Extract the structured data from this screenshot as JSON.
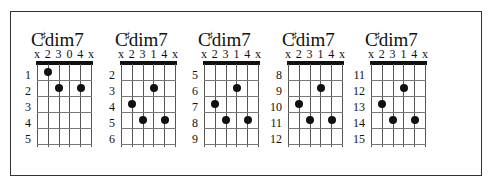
{
  "chord_name_root": "C",
  "chord_name_accidental": "♯",
  "chord_name_suffix": "dim7",
  "chords": [
    {
      "left": 37,
      "fingering": [
        "x",
        "2",
        "3",
        "0",
        "4",
        "x"
      ],
      "fret_labels": [
        "1",
        "2",
        "3",
        "4",
        "5"
      ],
      "dots": [
        {
          "string": 1,
          "row": 1
        },
        {
          "string": 2,
          "row": 2
        },
        {
          "string": 4,
          "row": 2
        }
      ]
    },
    {
      "left": 121,
      "fingering": [
        "x",
        "2",
        "3",
        "1",
        "4",
        "x"
      ],
      "fret_labels": [
        "2",
        "3",
        "4",
        "5",
        "6"
      ],
      "dots": [
        {
          "string": 3,
          "row": 2
        },
        {
          "string": 1,
          "row": 3
        },
        {
          "string": 2,
          "row": 4
        },
        {
          "string": 4,
          "row": 4
        }
      ]
    },
    {
      "left": 204,
      "fingering": [
        "x",
        "2",
        "3",
        "1",
        "4",
        "x"
      ],
      "fret_labels": [
        "5",
        "6",
        "7",
        "8",
        "9"
      ],
      "dots": [
        {
          "string": 3,
          "row": 2
        },
        {
          "string": 1,
          "row": 3
        },
        {
          "string": 2,
          "row": 4
        },
        {
          "string": 4,
          "row": 4
        }
      ]
    },
    {
      "left": 288,
      "fingering": [
        "x",
        "2",
        "3",
        "1",
        "4",
        "x"
      ],
      "fret_labels": [
        "8",
        "9",
        "10",
        "11",
        "12"
      ],
      "dots": [
        {
          "string": 3,
          "row": 2
        },
        {
          "string": 1,
          "row": 3
        },
        {
          "string": 2,
          "row": 4
        },
        {
          "string": 4,
          "row": 4
        }
      ]
    },
    {
      "left": 371,
      "fingering": [
        "x",
        "2",
        "3",
        "1",
        "4",
        "x"
      ],
      "fret_labels": [
        "11",
        "12",
        "13",
        "14",
        "15"
      ],
      "dots": [
        {
          "string": 3,
          "row": 2
        },
        {
          "string": 1,
          "row": 3
        },
        {
          "string": 2,
          "row": 4
        },
        {
          "string": 4,
          "row": 4
        }
      ]
    }
  ]
}
